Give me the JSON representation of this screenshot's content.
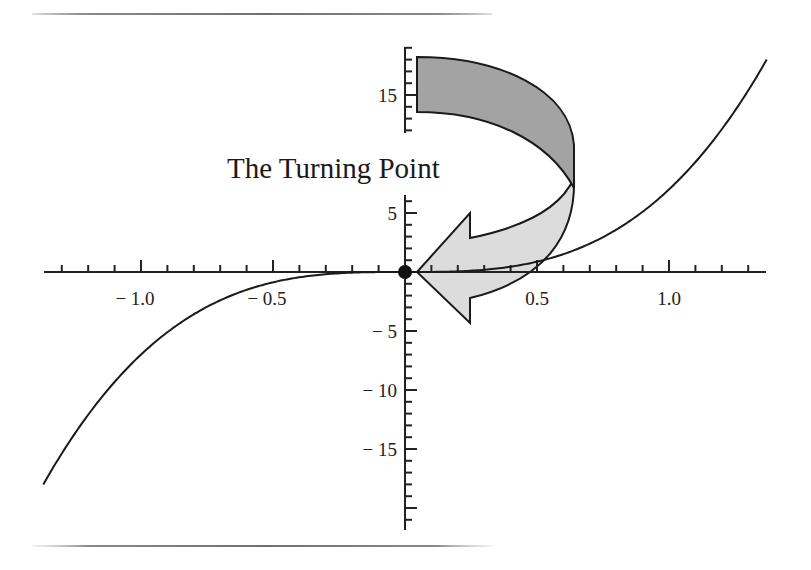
{
  "title": "The Turning Point",
  "chart_data": {
    "type": "line",
    "title": "The Turning Point",
    "function": "y = 7x^3",
    "xlabel": "",
    "ylabel": "",
    "xlim": [
      -1.37,
      1.37
    ],
    "ylim": [
      -19,
      19
    ],
    "x_ticks": [
      -1.0,
      -0.5,
      0.5,
      1.0
    ],
    "x_tick_labels": [
      "− 1.0",
      "− 0.5",
      "0.5",
      "1.0"
    ],
    "y_ticks": [
      -15,
      -10,
      -5,
      5,
      15
    ],
    "y_tick_labels": [
      "− 15",
      "− 10",
      "− 5",
      "5",
      "15"
    ],
    "x_minor_tick_step": 0.1,
    "y_minor_tick_step": 1,
    "grid": false,
    "series": [
      {
        "name": "cubic",
        "x": [
          -1.37,
          -1.2,
          -1.0,
          -0.8,
          -0.6,
          -0.4,
          -0.2,
          0,
          0.2,
          0.4,
          0.6,
          0.8,
          1.0,
          1.2,
          1.37
        ],
        "y": [
          -18.0,
          -12.1,
          -7.0,
          -3.58,
          -1.51,
          -0.45,
          -0.06,
          0,
          0.06,
          0.45,
          1.51,
          3.58,
          7.0,
          12.1,
          18.0
        ]
      }
    ],
    "annotations": [
      {
        "type": "point",
        "x": 0,
        "y": 0,
        "label": "turning point marker"
      },
      {
        "type": "curved-arrow",
        "from": [
          0.05,
          15
        ],
        "to": [
          0.05,
          0
        ],
        "text": "The Turning Point"
      }
    ]
  },
  "colors": {
    "curve": "#1a1a1a",
    "axis": "#222222",
    "arrow_band": "#a0a0a0",
    "arrow_body": "#dcdcdc",
    "point": "#111111"
  }
}
